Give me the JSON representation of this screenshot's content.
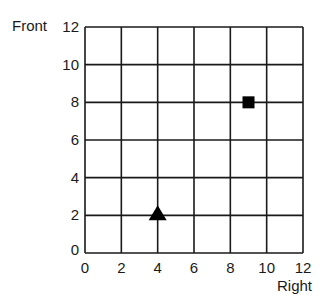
{
  "chart_data": {
    "type": "scatter",
    "title": "",
    "xlabel": "Right",
    "ylabel": "Front",
    "xlim": [
      0,
      12
    ],
    "ylim": [
      0,
      12
    ],
    "x_ticks": [
      0,
      2,
      4,
      6,
      8,
      10,
      12
    ],
    "y_ticks": [
      0,
      2,
      4,
      6,
      8,
      10,
      12
    ],
    "grid": true,
    "series": [
      {
        "name": "triangle",
        "marker": "triangle",
        "color": "#000000",
        "points": [
          {
            "x": 4,
            "y": 2
          }
        ]
      },
      {
        "name": "square",
        "marker": "square",
        "color": "#000000",
        "points": [
          {
            "x": 9,
            "y": 8
          }
        ]
      }
    ]
  },
  "labels": {
    "x_axis": "Right",
    "y_axis": "Front",
    "x_ticks": [
      "0",
      "2",
      "4",
      "6",
      "8",
      "10",
      "12"
    ],
    "y_ticks": [
      "0",
      "2",
      "4",
      "6",
      "8",
      "10",
      "12"
    ]
  }
}
